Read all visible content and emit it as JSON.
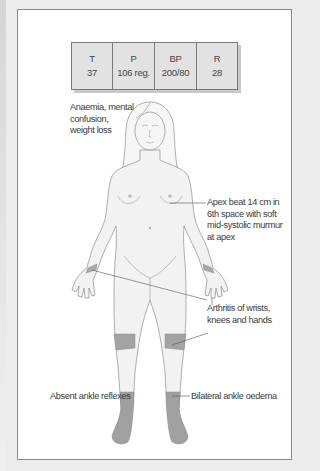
{
  "vitals": {
    "cells": [
      {
        "key": "T",
        "value": "37"
      },
      {
        "key": "P",
        "value": "106 reg."
      },
      {
        "key": "BP",
        "value": "200/80"
      },
      {
        "key": "R",
        "value": "28"
      }
    ]
  },
  "annotations": {
    "general": [
      "Anaemia, mental",
      "confusion,",
      "weight loss"
    ],
    "apex": [
      "Apex beat 14 cm in",
      "6th space with soft",
      "mid-systolic murmur",
      "at apex"
    ],
    "arthritis": [
      "Arthritis of wrists,",
      "knees and hands"
    ],
    "reflexes": "Absent ankle reflexes",
    "oedema": "Bilateral ankle oedema"
  },
  "colors": {
    "body_fill": "#f2f2f2",
    "outline": "#8c8c8c",
    "highlight": "#9e9e9e",
    "table_fill": "#e2e2e2"
  }
}
